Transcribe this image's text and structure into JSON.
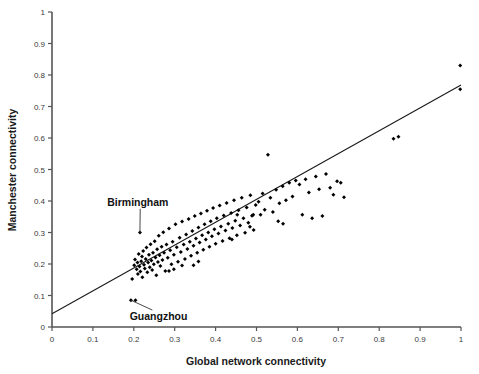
{
  "chart_data": {
    "type": "scatter",
    "title": "",
    "xlabel": "Global network connectivity",
    "ylabel": "Manchester connectivity",
    "xlim": [
      0,
      1
    ],
    "ylim": [
      0,
      1
    ],
    "grid": false,
    "legend": "none",
    "xticks": [
      "0",
      "0.1",
      "0.2",
      "0.3",
      "0.4",
      "0.5",
      "0.6",
      "0.7",
      "0.8",
      "0.9",
      "1"
    ],
    "xtick_values": [
      0,
      0.1,
      0.2,
      0.3,
      0.4,
      0.5,
      0.6,
      0.7,
      0.8,
      0.9,
      1
    ],
    "yticks": [
      "0",
      "0.1",
      "0.2",
      "0.3",
      "0.4",
      "0.5",
      "0.6",
      "0.7",
      "0.8",
      "0.9",
      "1"
    ],
    "ytick_values": [
      0,
      0.1,
      0.2,
      0.3,
      0.4,
      0.5,
      0.6,
      0.7,
      0.8,
      0.9,
      1
    ],
    "marker": "filled-diamond",
    "marker_color": "#000000",
    "point_count": 148,
    "trendline": {
      "type": "linear",
      "color": "#1a1a1a",
      "x_start": 0.0,
      "y_start": 0.042,
      "x_end": 1.0,
      "y_end": 0.768,
      "slope": 0.726,
      "intercept": 0.042
    },
    "points": [
      [
        0.193,
        0.085
      ],
      [
        0.204,
        0.085
      ],
      [
        0.215,
        0.3
      ],
      [
        0.196,
        0.152
      ],
      [
        0.201,
        0.196
      ],
      [
        0.203,
        0.214
      ],
      [
        0.207,
        0.183
      ],
      [
        0.209,
        0.205
      ],
      [
        0.21,
        0.168
      ],
      [
        0.212,
        0.232
      ],
      [
        0.214,
        0.192
      ],
      [
        0.216,
        0.176
      ],
      [
        0.218,
        0.209
      ],
      [
        0.22,
        0.224
      ],
      [
        0.221,
        0.158
      ],
      [
        0.223,
        0.241
      ],
      [
        0.225,
        0.198
      ],
      [
        0.227,
        0.186
      ],
      [
        0.229,
        0.216
      ],
      [
        0.231,
        0.252
      ],
      [
        0.233,
        0.174
      ],
      [
        0.235,
        0.205
      ],
      [
        0.237,
        0.229
      ],
      [
        0.239,
        0.19
      ],
      [
        0.241,
        0.263
      ],
      [
        0.243,
        0.211
      ],
      [
        0.245,
        0.181
      ],
      [
        0.247,
        0.236
      ],
      [
        0.249,
        0.199
      ],
      [
        0.251,
        0.272
      ],
      [
        0.253,
        0.221
      ],
      [
        0.255,
        0.164
      ],
      [
        0.257,
        0.247
      ],
      [
        0.259,
        0.206
      ],
      [
        0.261,
        0.29
      ],
      [
        0.263,
        0.228
      ],
      [
        0.265,
        0.194
      ],
      [
        0.268,
        0.255
      ],
      [
        0.27,
        0.213
      ],
      [
        0.272,
        0.301
      ],
      [
        0.274,
        0.236
      ],
      [
        0.277,
        0.178
      ],
      [
        0.28,
        0.262
      ],
      [
        0.283,
        0.22
      ],
      [
        0.286,
        0.313
      ],
      [
        0.289,
        0.244
      ],
      [
        0.292,
        0.199
      ],
      [
        0.295,
        0.271
      ],
      [
        0.298,
        0.229
      ],
      [
        0.302,
        0.326
      ],
      [
        0.305,
        0.253
      ],
      [
        0.308,
        0.207
      ],
      [
        0.312,
        0.283
      ],
      [
        0.315,
        0.238
      ],
      [
        0.318,
        0.335
      ],
      [
        0.322,
        0.262
      ],
      [
        0.325,
        0.216
      ],
      [
        0.328,
        0.294
      ],
      [
        0.331,
        0.248
      ],
      [
        0.334,
        0.343
      ],
      [
        0.337,
        0.271
      ],
      [
        0.34,
        0.226
      ],
      [
        0.343,
        0.305
      ],
      [
        0.346,
        0.258
      ],
      [
        0.349,
        0.352
      ],
      [
        0.352,
        0.281
      ],
      [
        0.355,
        0.236
      ],
      [
        0.358,
        0.316
      ],
      [
        0.361,
        0.268
      ],
      [
        0.364,
        0.36
      ],
      [
        0.367,
        0.291
      ],
      [
        0.37,
        0.245
      ],
      [
        0.373,
        0.326
      ],
      [
        0.376,
        0.278
      ],
      [
        0.379,
        0.369
      ],
      [
        0.382,
        0.3
      ],
      [
        0.385,
        0.255
      ],
      [
        0.388,
        0.336
      ],
      [
        0.391,
        0.288
      ],
      [
        0.394,
        0.378
      ],
      [
        0.397,
        0.31
      ],
      [
        0.4,
        0.264
      ],
      [
        0.403,
        0.345
      ],
      [
        0.407,
        0.297
      ],
      [
        0.41,
        0.386
      ],
      [
        0.413,
        0.319
      ],
      [
        0.417,
        0.273
      ],
      [
        0.42,
        0.354
      ],
      [
        0.424,
        0.306
      ],
      [
        0.427,
        0.394
      ],
      [
        0.431,
        0.328
      ],
      [
        0.434,
        0.282
      ],
      [
        0.438,
        0.362
      ],
      [
        0.441,
        0.314
      ],
      [
        0.445,
        0.402
      ],
      [
        0.448,
        0.337
      ],
      [
        0.452,
        0.291
      ],
      [
        0.456,
        0.371
      ],
      [
        0.46,
        0.322
      ],
      [
        0.464,
        0.41
      ],
      [
        0.468,
        0.345
      ],
      [
        0.472,
        0.299
      ],
      [
        0.476,
        0.379
      ],
      [
        0.48,
        0.331
      ],
      [
        0.485,
        0.418
      ],
      [
        0.489,
        0.353
      ],
      [
        0.493,
        0.308
      ],
      [
        0.498,
        0.387
      ],
      [
        0.505,
        0.398
      ],
      [
        0.51,
        0.356
      ],
      [
        0.515,
        0.424
      ],
      [
        0.52,
        0.372
      ],
      [
        0.528,
        0.547
      ],
      [
        0.534,
        0.41
      ],
      [
        0.54,
        0.365
      ],
      [
        0.548,
        0.436
      ],
      [
        0.556,
        0.393
      ],
      [
        0.564,
        0.447
      ],
      [
        0.572,
        0.402
      ],
      [
        0.58,
        0.458
      ],
      [
        0.588,
        0.414
      ],
      [
        0.596,
        0.465
      ],
      [
        0.605,
        0.452
      ],
      [
        0.612,
        0.356
      ],
      [
        0.62,
        0.469
      ],
      [
        0.628,
        0.427
      ],
      [
        0.636,
        0.345
      ],
      [
        0.645,
        0.478
      ],
      [
        0.653,
        0.437
      ],
      [
        0.661,
        0.352
      ],
      [
        0.67,
        0.486
      ],
      [
        0.68,
        0.442
      ],
      [
        0.688,
        0.42
      ],
      [
        0.697,
        0.463
      ],
      [
        0.706,
        0.458
      ],
      [
        0.714,
        0.412
      ],
      [
        0.553,
        0.336
      ],
      [
        0.565,
        0.328
      ],
      [
        0.492,
        0.356
      ],
      [
        0.484,
        0.318
      ],
      [
        0.453,
        0.356
      ],
      [
        0.44,
        0.278
      ],
      [
        0.346,
        0.196
      ],
      [
        0.358,
        0.208
      ],
      [
        0.298,
        0.183
      ],
      [
        0.286,
        0.178
      ],
      [
        0.318,
        0.195
      ],
      [
        0.835,
        0.598
      ],
      [
        0.847,
        0.604
      ],
      [
        0.998,
        0.83
      ],
      [
        0.998,
        0.755
      ]
    ],
    "annotations": [
      {
        "label": "Birmingham",
        "label_x": 0.135,
        "label_y": 0.385,
        "point_x": 0.215,
        "point_y": 0.3
      },
      {
        "label": "Guangzhou",
        "label_x": 0.19,
        "label_y": 0.022,
        "point_x": 0.193,
        "point_y": 0.085
      }
    ]
  }
}
